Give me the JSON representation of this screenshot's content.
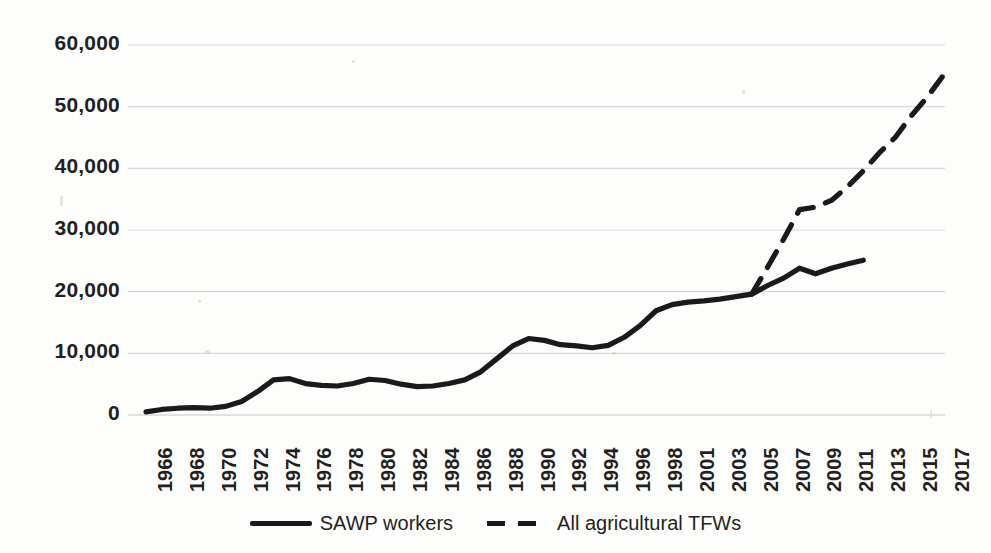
{
  "chart_data": {
    "type": "line",
    "title": "",
    "subtitle": "",
    "xlabel": "",
    "ylabel": "",
    "grid": true,
    "legend_position": "bottom",
    "ylim": [
      0,
      60000
    ],
    "yticks": [
      0,
      10000,
      20000,
      30000,
      40000,
      50000,
      60000
    ],
    "ytick_labels": [
      "0",
      "10,000",
      "20,000",
      "30,000",
      "40,000",
      "50,000",
      "60,000"
    ],
    "categories": [
      "1966",
      "1967",
      "1968",
      "1969",
      "1970",
      "1971",
      "1972",
      "1973",
      "1974",
      "1975",
      "1976",
      "1977",
      "1978",
      "1979",
      "1980",
      "1981",
      "1982",
      "1983",
      "1984",
      "1985",
      "1986",
      "1987",
      "1988",
      "1989",
      "1990",
      "1991",
      "1992",
      "1993",
      "1994",
      "1995",
      "1996",
      "1997",
      "1998",
      "1999",
      "2001",
      "2002",
      "2003",
      "2004",
      "2005",
      "2006",
      "2007",
      "2008",
      "2009",
      "2010",
      "2011",
      "2012",
      "2013",
      "2014",
      "2015",
      "2016",
      "2017"
    ],
    "xtick_labels": [
      "1966",
      "1968",
      "1970",
      "1972",
      "1974",
      "1976",
      "1978",
      "1980",
      "1982",
      "1984",
      "1986",
      "1988",
      "1990",
      "1992",
      "1994",
      "1996",
      "1998",
      "2001",
      "2003",
      "2005",
      "2007",
      "2009",
      "2011",
      "2013",
      "2015",
      "2017"
    ],
    "series": [
      {
        "name": "SAWP workers",
        "style": "solid",
        "color": "#1a1a1a",
        "x": [
          "1966",
          "1967",
          "1968",
          "1969",
          "1970",
          "1971",
          "1972",
          "1973",
          "1974",
          "1975",
          "1976",
          "1977",
          "1978",
          "1979",
          "1980",
          "1981",
          "1982",
          "1983",
          "1984",
          "1985",
          "1986",
          "1987",
          "1988",
          "1989",
          "1990",
          "1991",
          "1992",
          "1993",
          "1994",
          "1995",
          "1996",
          "1997",
          "1998",
          "1999",
          "2001",
          "2002",
          "2003",
          "2004",
          "2005",
          "2006",
          "2007",
          "2008",
          "2009",
          "2010",
          "2011",
          "2012"
        ],
        "values": [
          500,
          900,
          1100,
          1200,
          1100,
          1400,
          2200,
          3800,
          5700,
          5900,
          5100,
          4800,
          4700,
          5100,
          5800,
          5600,
          5000,
          4600,
          4700,
          5100,
          5700,
          7000,
          9100,
          11200,
          12400,
          12100,
          11400,
          11200,
          10900,
          11300,
          12600,
          14500,
          16900,
          17900,
          18300,
          18500,
          18800,
          19200,
          19600,
          21000,
          22200,
          23800,
          22900,
          23800,
          24500,
          25100
        ]
      },
      {
        "name": "All agricultural TFWs",
        "style": "dashed",
        "color": "#1a1a1a",
        "x": [
          "2005",
          "2006",
          "2007",
          "2008",
          "2009",
          "2010",
          "2011",
          "2012",
          "2013",
          "2014",
          "2015",
          "2016",
          "2017"
        ],
        "values": [
          19600,
          24000,
          28500,
          33300,
          33700,
          34800,
          37000,
          39600,
          42500,
          45000,
          48500,
          51500,
          55000
        ]
      }
    ]
  },
  "legend": {
    "items": [
      {
        "label": "SAWP workers",
        "style": "solid"
      },
      {
        "label": "All agricultural TFWs",
        "style": "dashed"
      }
    ]
  }
}
